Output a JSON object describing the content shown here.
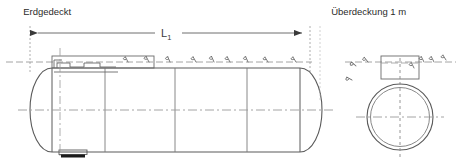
{
  "figure": {
    "kind": "technical-drawing",
    "language": "de",
    "views": [
      "Längsschnitt (Seitenansicht)",
      "Querschnitt (Stirnansicht)"
    ]
  },
  "labels": {
    "top_left": "Erdgedeckt",
    "top_right": "Überdeckung 1 m",
    "dimension_main": "L",
    "dimension_main_subscript": "1"
  },
  "colors": {
    "outline": "#5a5a5a",
    "outline_dark": "#3c3c3c",
    "centerline": "#9a9a9a",
    "extension": "#8c8c8c",
    "dimension": "#6e6e6e",
    "ground_hatch": "#6a6a6a",
    "text": "#2b2b2b",
    "background": "#ffffff",
    "support_fill": "#1a1a1a"
  },
  "side_view": {
    "name": "tank-side-view",
    "tank_left_x": 30,
    "tank_right_x": 320,
    "tank_top_y": 68,
    "tank_bottom_y": 152,
    "dome_cap_radius": 22,
    "seam_positions_x": [
      105,
      175,
      247
    ],
    "centerline_y": 110,
    "ground_line_y": 62,
    "support_foot": {
      "x": 60,
      "y": 152,
      "width": 26,
      "height": 6
    },
    "dome_fitting_label": "Domschacht / Armaturen"
  },
  "end_view": {
    "name": "tank-end-cross-section",
    "center_x": 400,
    "center_y": 117,
    "outer_radius": 33,
    "inner_radius": 30,
    "dome_box": {
      "x": 381,
      "y": 56,
      "width": 38,
      "height": 22
    },
    "centerline_h_y": 117,
    "centerline_v_x": 400
  },
  "ground_hatching": {
    "name": "earth-hatch-symbols",
    "side_view_count": 9,
    "side_view_start_x": 128,
    "side_view_spacing": 21,
    "side_view_y": 62,
    "end_view_left_count": 3,
    "end_view_right_count": 4
  },
  "dimension_line": {
    "name": "dimension-L1",
    "y": 33,
    "x_start": 30,
    "x_end": 310,
    "arrow_style": "filled-triangle-outward",
    "extension_left_x": 30,
    "extension_right_x": 310,
    "extension_top_y": 26,
    "extension_bottom_y": 70
  }
}
